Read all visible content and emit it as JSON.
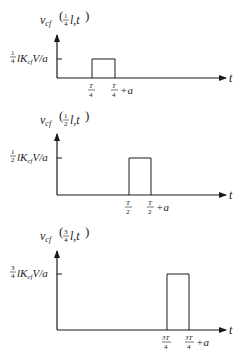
{
  "figure": {
    "panels": [
      {
        "ylabel_prefix": "v",
        "ylabel_sub": "cf",
        "ylabel_frac_num": "1",
        "ylabel_frac_den": "4",
        "ylabel_suffix": "l,t",
        "level_frac_num": "1",
        "level_frac_den": "4",
        "level_text": "lK",
        "level_sub": "cf",
        "level_tail": "V/a",
        "start_num": "T",
        "start_den": "4",
        "end_num": "T",
        "end_den": "4",
        "end_tail": "+a",
        "xlabel": "t"
      },
      {
        "ylabel_prefix": "v",
        "ylabel_sub": "cf",
        "ylabel_frac_num": "1",
        "ylabel_frac_den": "2",
        "ylabel_suffix": "l,t",
        "level_frac_num": "1",
        "level_frac_den": "2",
        "level_text": "lK",
        "level_sub": "cf",
        "level_tail": "V/a",
        "start_num": "T",
        "start_den": "2",
        "end_num": "T",
        "end_den": "2",
        "end_tail": "+a",
        "xlabel": "t"
      },
      {
        "ylabel_prefix": "v",
        "ylabel_sub": "cf",
        "ylabel_frac_num": "3",
        "ylabel_frac_den": "4",
        "ylabel_suffix": "l,t",
        "level_frac_num": "3",
        "level_frac_den": "4",
        "level_text": "lK",
        "level_sub": "cf",
        "level_tail": "V/a",
        "start_num": "3T",
        "start_den": "4",
        "end_num": "3T",
        "end_den": "4",
        "end_tail": "+a",
        "xlabel": "t"
      }
    ]
  }
}
